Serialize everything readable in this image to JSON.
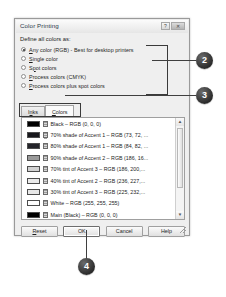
{
  "dialog": {
    "title": "Color Printing",
    "titlebar_buttons": [
      {
        "name": "help-button",
        "glyph": "?"
      },
      {
        "name": "close-button",
        "glyph": "✕"
      }
    ],
    "section_label": "Define all colors as:",
    "radio_options": [
      {
        "label_pre": "",
        "label_u": "A",
        "label_post": "ny color (RGB) - Best for desktop printers",
        "checked": true
      },
      {
        "label_pre": "",
        "label_u": "S",
        "label_post": "ingle color",
        "checked": false
      },
      {
        "label_pre": "S",
        "label_u": "p",
        "label_post": "ot colors",
        "checked": false
      },
      {
        "label_pre": "",
        "label_u": "P",
        "label_post": "rocess colors (CMYK)",
        "checked": false
      },
      {
        "label_pre": "",
        "label_u": "P",
        "label_post": "rocess colors plus spot colors",
        "checked": false
      }
    ],
    "tabs": [
      {
        "label_pre": "I",
        "label_u": "n",
        "label_post": "ks",
        "active": false
      },
      {
        "label_pre": "",
        "label_u": "C",
        "label_post": "olors",
        "active": true
      }
    ],
    "list_items": [
      {
        "swatch": "#000000",
        "text": "Black  –  RGB (0, 0, 0)"
      },
      {
        "swatch": "#18181c",
        "text": "70% shade of Accent 1  –  RGB (73, 72, ..."
      },
      {
        "swatch": "#24242a",
        "text": "80% shade of Accent 1  –  RGB (84, 82, ..."
      },
      {
        "swatch": "#9a9a9a",
        "text": "90% shade of Accent 2  –  RGB (186, 16..."
      },
      {
        "swatch": "#d2d2d2",
        "text": "70% tint of Accent 3  –  RGB (186, 200,..."
      },
      {
        "swatch": "#ebebeb",
        "text": "40% tint of Accent 2  –  RGB (236, 227,..."
      },
      {
        "swatch": "#e8e8e8",
        "text": "30% tint of Accent 3  –  RGB (225, 232,..."
      },
      {
        "swatch": "#ffffff",
        "text": "White  –  RGB (255, 255, 255)"
      },
      {
        "swatch": "#000000",
        "text": "Main (Black)  –  RGB (0, 0, 0)"
      }
    ],
    "scrollbar": {
      "up_glyph": "▲",
      "down_glyph": "▼"
    },
    "buttons": [
      {
        "label_pre": "",
        "label_u": "R",
        "label_post": "eset",
        "default": false
      },
      {
        "label_pre": "",
        "label_u": "",
        "label_post": "OK",
        "default": true
      },
      {
        "label_pre": "",
        "label_u": "",
        "label_post": "Cancel",
        "default": false
      },
      {
        "label_pre": "",
        "label_u": "",
        "label_post": "Help",
        "default": false
      }
    ]
  },
  "callouts": [
    {
      "number": "2"
    },
    {
      "number": "3"
    },
    {
      "number": "4"
    }
  ],
  "colors": {
    "callout_fill": "#2b2b2b",
    "callout_text": "#ffffff",
    "dialog_face": "#efefef",
    "list_background": "#ffffff",
    "border": "#9a9a9a"
  }
}
